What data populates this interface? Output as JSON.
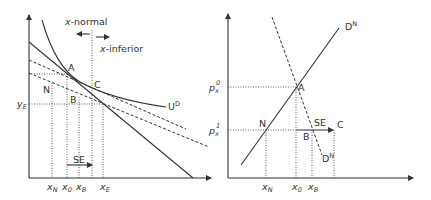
{
  "left_panel": {
    "annotations": {
      "x_normal": "x-normal",
      "x_inferior": "x-inferior",
      "x_normal_prefix": "x",
      "x_normal_suffix": "-normal",
      "x_inferior_prefix": "x",
      "x_inferior_suffix": "-inferior"
    },
    "points": {
      "A": "A",
      "B": "B",
      "C": "C",
      "N": "N"
    },
    "curve_labels": {
      "indifference": "U",
      "indifference_sup": "D"
    },
    "y_axis_label": {
      "base": "y",
      "sub": "E"
    },
    "x_ticks": [
      {
        "base": "x",
        "sub": "N"
      },
      {
        "base": "x",
        "sub": "0"
      },
      {
        "base": "x",
        "sub": "B"
      },
      {
        "base": "x",
        "sub": "E"
      }
    ],
    "substitution_effect": "SE"
  },
  "right_panel": {
    "y_ticks": [
      {
        "base": "p",
        "sub": "x",
        "sup": "0"
      },
      {
        "base": "p",
        "sub": "x",
        "sup": "1"
      }
    ],
    "points": {
      "A": "A",
      "N": "N",
      "B": "B",
      "C": "C"
    },
    "curve_labels": {
      "normal_demand": "D",
      "normal_demand_sup": "N",
      "dashed_demand": "D",
      "dashed_demand_sup": "N"
    },
    "x_ticks": [
      {
        "base": "x",
        "sub": "N"
      },
      {
        "base": "x",
        "sub": "0"
      },
      {
        "base": "x",
        "sub": "B"
      }
    ],
    "substitution_effect": "SE"
  },
  "colors": {
    "line": "#333333",
    "text": "#333333",
    "background": "#ffffff"
  }
}
